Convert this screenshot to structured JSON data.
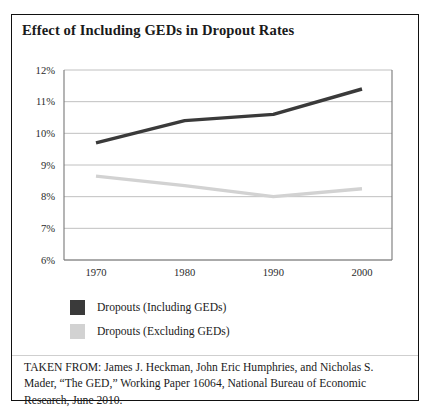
{
  "figure": {
    "title": "Effect of Including GEDs in Dropout Rates",
    "citation": "TAKEN FROM: James J. Heckman, John Eric Humphries, and Nicholas S. Mader, “The GED,” Working Paper 16064, National Bureau of Economic Research, June 2010."
  },
  "legend": {
    "items": [
      {
        "label": "Dropouts (Including GEDs)",
        "color": "#3a3a3a"
      },
      {
        "label": "Dropouts (Excluding GEDs)",
        "color": "#d2d2d2"
      }
    ]
  },
  "axes": {
    "y_ticks": [
      "12%",
      "11%",
      "10%",
      "9%",
      "8%",
      "7%",
      "6%"
    ],
    "x_ticks": [
      "1970",
      "1980",
      "1990",
      "2000"
    ]
  },
  "chart_data": {
    "type": "line",
    "title": "Effect of Including GEDs in Dropout Rates",
    "xlabel": "",
    "ylabel": "",
    "x": [
      1970,
      1980,
      1990,
      2000
    ],
    "categories": [
      "1970",
      "1980",
      "1990",
      "2000"
    ],
    "series": [
      {
        "name": "Dropouts (Including GEDs)",
        "color": "#3a3a3a",
        "values": [
          9.7,
          10.4,
          10.6,
          11.4
        ]
      },
      {
        "name": "Dropouts (Excluding GEDs)",
        "color": "#d2d2d2",
        "values": [
          8.65,
          8.35,
          8.0,
          8.25
        ]
      }
    ],
    "ylim": [
      6,
      12
    ],
    "ytick_values": [
      12,
      11,
      10,
      9,
      8,
      7,
      6
    ],
    "ytick_labels": [
      "12%",
      "11%",
      "10%",
      "9%",
      "8%",
      "7%",
      "6%"
    ],
    "xlim": [
      1965,
      2005
    ],
    "grid": true,
    "grid_axis": "y",
    "legend_position": "bottom-left",
    "y_unit": "percent"
  }
}
